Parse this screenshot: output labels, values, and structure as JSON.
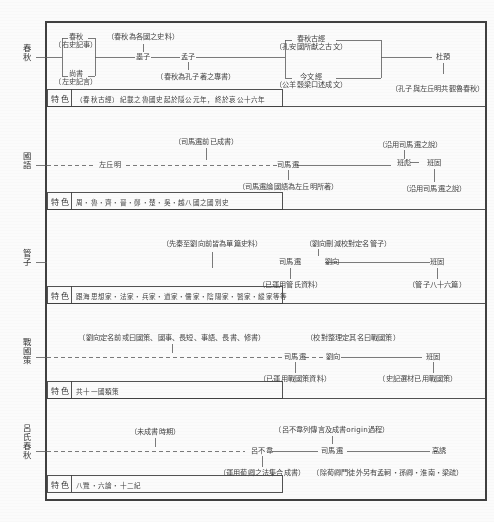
{
  "document": {
    "type": "textual-transmission-lineage-chart",
    "language": "zh-Hant",
    "feature_row_label": "特色"
  },
  "sections": [
    {
      "id": "chunqiu",
      "label": "春秋",
      "nodes": [
        {
          "name": "chunqiu-right-historian",
          "text": "春秋\n（右史記事）"
        },
        {
          "name": "shangshu-left-historian",
          "text": "尚書\n（左史記言）"
        },
        {
          "name": "mozi",
          "text": "墨子"
        },
        {
          "name": "mengzi",
          "text": "孟子"
        },
        {
          "name": "guwen-school",
          "text": "春秋古經\n（孔安國所獻之古文）"
        },
        {
          "name": "jinwen-school",
          "text": "今文經\n（公羊穀梁口述成文）"
        },
        {
          "name": "duyu",
          "text": "杜預"
        }
      ],
      "annotations": [
        {
          "name": "annot-chunqiu-states-history",
          "text": "（春秋為各國之史料）"
        },
        {
          "name": "annot-chunqiu-confucius-book",
          "text": "（春秋為孔子著之專書）"
        },
        {
          "name": "annot-confucius-zuoqiuming",
          "text": "（孔子與左丘明共觀魯春秋）"
        }
      ],
      "feature": "（春秋古經）紀載之魯國史起於隱公元年，終於哀公十六年"
    },
    {
      "id": "guoyu",
      "label": "國語",
      "nodes": [
        {
          "name": "zuoqiuming",
          "text": "左丘明"
        },
        {
          "name": "sima-qian",
          "text": "司馬遷"
        },
        {
          "name": "banbiao",
          "text": "班彪"
        },
        {
          "name": "banggu",
          "text": "班固"
        }
      ],
      "annotations": [
        {
          "name": "annot-sima-qian-already-book",
          "text": "（司馬遷前已成書）"
        },
        {
          "name": "annot-sima-qian-authorship",
          "text": "（司馬遷論國語為左丘明所著）"
        },
        {
          "name": "annot-banbiao-follows-sima",
          "text": "（沿用司馬遷之說）"
        },
        {
          "name": "annot-bangu-follows-sima",
          "text": "（沿用司馬遷之說）"
        }
      ],
      "feature": "周・魯・齊・晉・鄭・楚・吳・越八國之國別史"
    },
    {
      "id": "guanzi",
      "label": "管子",
      "nodes": [
        {
          "name": "sima-qian",
          "text": "司馬遷"
        },
        {
          "name": "liuxiang",
          "text": "劉向"
        },
        {
          "name": "bangu",
          "text": "班固"
        }
      ],
      "annotations": [
        {
          "name": "annot-preqin-liuxiang-source",
          "text": "（先秦至劉向前皆為單篇史料）"
        },
        {
          "name": "annot-liuxiang-edit-named",
          "text": "（劉向刪減校對定名管子）"
        },
        {
          "name": "annot-used-guanzi-material",
          "text": "（已運用管氏資料）"
        },
        {
          "name": "annot-guanzi-86-chapters",
          "text": "（管子八十六篇）"
        }
      ],
      "feature": "跟海思想家・法家・兵家・道家・儒家・陰陽家・醫家・縱家等等"
    },
    {
      "id": "zhanguoce",
      "label": "戰國策",
      "nodes": [
        {
          "name": "sima-qian",
          "text": "司馬遷"
        },
        {
          "name": "liuxiang",
          "text": "劉向"
        },
        {
          "name": "bangu",
          "text": "班固"
        }
      ],
      "annotations": [
        {
          "name": "annot-liuxiang-original-names",
          "text": "（劉向定名前或曰國策、國事、長短、事語、長書、修書）"
        },
        {
          "name": "annot-liuxiang-named-zhanguoce",
          "text": "（校對整理定其名曰戰國策）"
        },
        {
          "name": "annot-used-zhanguoce-material",
          "text": "（已運用戰國策資料）"
        },
        {
          "name": "annot-shiji-used-zhanguoce",
          "text": "（史記選材已用戰國策）"
        }
      ],
      "feature": "共十一國類策"
    },
    {
      "id": "lvshichunqiu",
      "label": "呂氏春秋",
      "nodes": [
        {
          "name": "lv-buwei",
          "text": "呂不韋"
        },
        {
          "name": "sima-qian",
          "text": "司馬遷"
        },
        {
          "name": "gaoyou",
          "text": "高誘"
        }
      ],
      "annotations": [
        {
          "name": "annot-unfinished-period",
          "text": "（未成書時期）"
        },
        {
          "name": "annot-lv-buwei-compilation",
          "text": "（呂不韋列傳言及成書origin過程）"
        },
        {
          "name": "annot-used-xunqing-collection",
          "text": "（運用荀卿之法集合成書）"
        },
        {
          "name": "annot-gaoyou-school",
          "text": "（除荀卿門徒外另有孟軻・孫卿・淮南・梁疏）"
        }
      ],
      "feature": "八覽・六論・十二紀"
    }
  ]
}
